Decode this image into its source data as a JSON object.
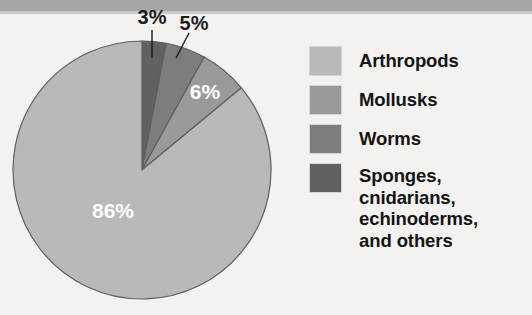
{
  "figure": {
    "kind": "pie-chart-with-legend"
  },
  "chart_data": {
    "type": "pie",
    "title": "",
    "subtitle": "",
    "xlabel": "",
    "ylabel": "",
    "legend_position": "right",
    "grid": false,
    "categories": [
      "Arthropods",
      "Mollusks",
      "Worms",
      "Sponges, cnidarians, echinoderms, and others"
    ],
    "values": [
      86,
      6,
      5,
      3
    ],
    "value_labels": [
      "86%",
      "6%",
      "5%",
      "3%"
    ],
    "unit": "%",
    "colors": [
      "#b9b9b9",
      "#9a9a9a",
      "#7d7d7d",
      "#616161"
    ],
    "slice_label_colors": [
      "#ffffff",
      "#ffffff",
      "#1b1b1b",
      "#1b1b1b"
    ],
    "start_angle_deg": 0,
    "direction": "clockwise",
    "annotations": [
      {
        "label": "3%",
        "type": "callout",
        "has_leader_line": true
      },
      {
        "label": "5%",
        "type": "callout",
        "has_leader_line": true
      },
      {
        "label": "6%",
        "type": "inside"
      },
      {
        "label": "86%",
        "type": "inside"
      }
    ]
  },
  "pie": {
    "center_x": 142,
    "center_y": 170,
    "radius": 129,
    "stroke": "#5e5e5e",
    "slices": [
      {
        "name": "sponges-cnidarians-echinoderms-others",
        "percent": 3,
        "label": "3%",
        "color": "#616161",
        "start_deg": 0,
        "end_deg": 10.8
      },
      {
        "name": "worms",
        "percent": 5,
        "label": "5%",
        "color": "#7d7d7d",
        "start_deg": 10.8,
        "end_deg": 28.8
      },
      {
        "name": "mollusks",
        "percent": 6,
        "label": "6%",
        "color": "#9a9a9a",
        "start_deg": 28.8,
        "end_deg": 50.4
      },
      {
        "name": "arthropods",
        "percent": 86,
        "label": "86%",
        "color": "#b9b9b9",
        "start_deg": 50.4,
        "end_deg": 360
      }
    ],
    "labels": {
      "three": "3%",
      "five": "5%",
      "six": "6%",
      "eightysix": "86%"
    }
  },
  "legend": {
    "items": [
      {
        "label": "Arthropods",
        "color": "#b9b9b9",
        "percent": "86%"
      },
      {
        "label": "Mollusks",
        "color": "#9a9a9a",
        "percent": "6%"
      },
      {
        "label": "Worms",
        "color": "#7d7d7d",
        "percent": "5%"
      },
      {
        "label": "Sponges,\ncnidarians,\nechinoderms,\nand others",
        "color": "#616161",
        "percent": "3%"
      }
    ]
  }
}
